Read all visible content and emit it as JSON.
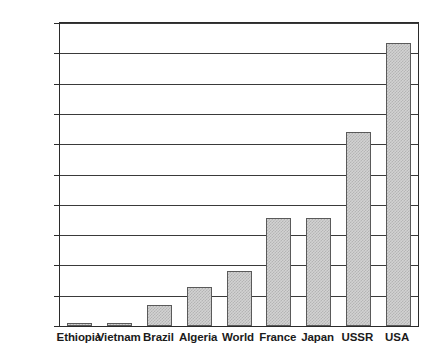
{
  "chart_data": {
    "type": "bar",
    "title": "",
    "subtitle": "",
    "xlabel": "",
    "ylabel": "",
    "categories": [
      "Ethiopia",
      "Vietnam",
      "Brazil",
      "Algeria",
      "World",
      "France",
      "Japan",
      "USSR",
      "USA"
    ],
    "values": [
      55,
      95,
      700,
      1300,
      1800,
      3570,
      3580,
      6400,
      9350
    ],
    "ylim": [
      0,
      10000
    ],
    "ytick_values": [
      0,
      1000,
      2000,
      3000,
      4000,
      5000,
      6000,
      7000,
      8000,
      9000,
      10000
    ],
    "ytick_labels": [
      "0",
      "1000",
      "2000",
      "3000",
      "4000",
      "5000",
      "6000",
      "7000",
      "8000",
      "9000",
      "10,000"
    ],
    "grid": true,
    "legend": false,
    "legend_position": "none",
    "bar_fill_color": "#d2d2d2",
    "bar_edge_color": "#5a5a5a",
    "axis_color": "#2b2b2b",
    "grid_color": "#3a3a3a",
    "background_color": "#ffffff"
  }
}
